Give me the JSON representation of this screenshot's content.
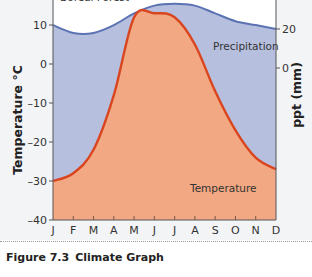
{
  "chart_data": {
    "type": "area",
    "title": "Climate Graph",
    "biome": "Boreal Forest",
    "categories": [
      "J",
      "F",
      "M",
      "A",
      "M",
      "J",
      "J",
      "A",
      "S",
      "O",
      "N",
      "D"
    ],
    "series": [
      {
        "name": "Temperature",
        "axis": "left",
        "unit": "°C",
        "color": "#d9451f",
        "fill": "#f2a882",
        "values": [
          -30,
          -28,
          -22,
          -8,
          12,
          13,
          12,
          5,
          -7,
          -17,
          -24,
          -27
        ]
      },
      {
        "name": "Precipitation",
        "axis": "right",
        "unit": "mm",
        "color": "#5b73b3",
        "fill": "#b7bfde",
        "values": [
          22,
          18,
          18,
          22,
          28,
          32,
          33,
          32,
          28,
          24,
          22,
          20
        ]
      }
    ],
    "ylabel": "Temperature °C",
    "ylabel_right": "ppt (mm)",
    "xlabel": "",
    "ylim": [
      -40,
      15
    ],
    "yticks": [
      10,
      0,
      -10,
      -20,
      -30,
      -40
    ],
    "yticks_labels": [
      "10",
      "0",
      "–10",
      "–20",
      "–30",
      "–40"
    ],
    "ylim_right": [
      -100,
      40
    ],
    "yticks_right": [
      20,
      0
    ],
    "grid": false,
    "legend": "inline labels"
  },
  "labels": {
    "biome": "Boreal Forest",
    "precipitation": "Precipitation",
    "temperature": "Temperature",
    "y_left_title": "Temperature °C",
    "y_right_title": "ppt (mm)",
    "y_left_ticks": [
      "10",
      "0",
      "–10",
      "–20",
      "–30",
      "–40"
    ],
    "y_right_ticks": [
      "20",
      "0"
    ],
    "months": [
      "J",
      "F",
      "M",
      "A",
      "M",
      "J",
      "J",
      "A",
      "S",
      "O",
      "N",
      "D"
    ]
  },
  "caption": {
    "number": "Figure 7.3",
    "title": "Climate Graph"
  },
  "colors": {
    "temperature_line": "#d9451f",
    "temperature_fill": "#f2a882",
    "precipitation_line": "#5b73b3",
    "precipitation_fill": "#b7bfde",
    "axis": "#555555"
  }
}
